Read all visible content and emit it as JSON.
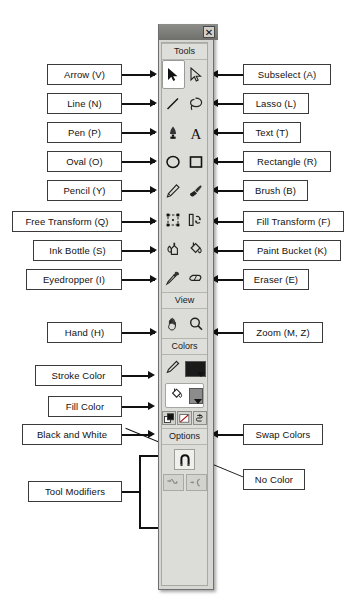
{
  "panel": {
    "close_label": "✕",
    "sections": {
      "tools": "Tools",
      "view": "View",
      "colors": "Colors",
      "options": "Options"
    },
    "tools": [
      {
        "name": "arrow",
        "icon": "arrow-icon",
        "selected": true
      },
      {
        "name": "subselect",
        "icon": "subselect-icon",
        "selected": false
      },
      {
        "name": "line",
        "icon": "line-icon",
        "selected": false
      },
      {
        "name": "lasso",
        "icon": "lasso-icon",
        "selected": false
      },
      {
        "name": "pen",
        "icon": "pen-icon",
        "selected": false
      },
      {
        "name": "text",
        "icon": "text-icon",
        "selected": false
      },
      {
        "name": "oval",
        "icon": "oval-icon",
        "selected": false
      },
      {
        "name": "rectangle",
        "icon": "rectangle-icon",
        "selected": false
      },
      {
        "name": "pencil",
        "icon": "pencil-icon",
        "selected": false
      },
      {
        "name": "brush",
        "icon": "brush-icon",
        "selected": false
      },
      {
        "name": "free-transform",
        "icon": "free-transform-icon",
        "selected": false
      },
      {
        "name": "fill-transform",
        "icon": "fill-transform-icon",
        "selected": false
      },
      {
        "name": "ink-bottle",
        "icon": "ink-bottle-icon",
        "selected": false
      },
      {
        "name": "paint-bucket",
        "icon": "paint-bucket-icon",
        "selected": false
      },
      {
        "name": "eyedropper",
        "icon": "eyedropper-icon",
        "selected": false
      },
      {
        "name": "eraser",
        "icon": "eraser-icon",
        "selected": false
      }
    ],
    "view_tools": [
      {
        "name": "hand",
        "icon": "hand-icon"
      },
      {
        "name": "zoom",
        "icon": "magnifier-icon"
      }
    ],
    "colors": {
      "stroke_color": "#1a1a1a",
      "fill_color": "#8c8c8c",
      "stroke_icon": "pencil-stroke-icon",
      "fill_icon": "paint-bucket-fill-icon",
      "black_and_white_icon": "black-and-white-icon",
      "no_color_icon": "no-color-icon",
      "swap_colors_icon": "swap-colors-icon"
    },
    "options": {
      "magnet_icon": "snap-magnet-icon",
      "smooth_icon": "smooth-icon",
      "straighten_icon": "straighten-icon"
    }
  },
  "labels_left": [
    {
      "id": "arrow",
      "text": "Arrow (V)"
    },
    {
      "id": "line",
      "text": "Line (N)"
    },
    {
      "id": "pen",
      "text": "Pen (P)"
    },
    {
      "id": "oval",
      "text": "Oval (O)"
    },
    {
      "id": "pencil",
      "text": "Pencil (Y)"
    },
    {
      "id": "free-transform",
      "text": "Free Transform (Q)"
    },
    {
      "id": "ink-bottle",
      "text": "Ink Bottle (S)"
    },
    {
      "id": "eyedropper",
      "text": "Eyedropper (I)"
    },
    {
      "id": "hand",
      "text": "Hand (H)"
    },
    {
      "id": "stroke-color",
      "text": "Stroke Color"
    },
    {
      "id": "fill-color",
      "text": "Fill Color"
    },
    {
      "id": "black-white",
      "text": "Black and White"
    },
    {
      "id": "tool-modifiers",
      "text": "Tool Modifiers"
    }
  ],
  "labels_right": [
    {
      "id": "subselect",
      "text": "Subselect (A)"
    },
    {
      "id": "lasso",
      "text": "Lasso (L)"
    },
    {
      "id": "text",
      "text": "Text (T)"
    },
    {
      "id": "rectangle",
      "text": "Rectangle (R)"
    },
    {
      "id": "brush",
      "text": "Brush (B)"
    },
    {
      "id": "fill-transform",
      "text": "Fill Transform (F)"
    },
    {
      "id": "paint-bucket",
      "text": "Paint Bucket (K)"
    },
    {
      "id": "eraser",
      "text": "Eraser (E)"
    },
    {
      "id": "zoom",
      "text": "Zoom (M, Z)"
    },
    {
      "id": "swap-colors",
      "text": "Swap Colors"
    },
    {
      "id": "no-color",
      "text": "No Color"
    }
  ]
}
